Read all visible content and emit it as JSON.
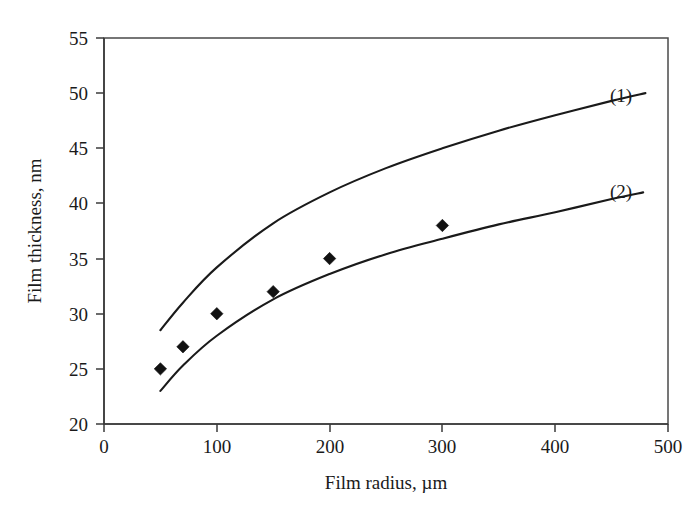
{
  "chart_data": {
    "type": "scatter",
    "title": "",
    "xlabel": "Film radius, µm",
    "ylabel": "Film thickness, nm",
    "xlim": [
      0,
      500
    ],
    "ylim": [
      20,
      55
    ],
    "xticks": [
      "0",
      "100",
      "200",
      "300",
      "400",
      "500"
    ],
    "xtick_values": [
      0,
      100,
      200,
      300,
      400,
      500
    ],
    "yticks": [
      "20",
      "25",
      "30",
      "35",
      "40",
      "45",
      "50",
      "55"
    ],
    "ytick_values": [
      20,
      25,
      30,
      35,
      40,
      45,
      50,
      55
    ],
    "grid": false,
    "legend_position": "inline-right-of-curve-ends",
    "frame": "full-box",
    "background": "#ffffff",
    "foreground": "#1a1a1a",
    "series": [
      {
        "name": "(1)",
        "label": "(1)",
        "type": "line",
        "marker": "none",
        "color": "#1a1a1a",
        "x": [
          50,
          70,
          100,
          150,
          200,
          250,
          300,
          350,
          400,
          450,
          480
        ],
        "y": [
          28.5,
          31.0,
          34.2,
          38.2,
          41.0,
          43.2,
          45.0,
          46.6,
          48.0,
          49.3,
          50.0
        ]
      },
      {
        "name": "(2)",
        "label": "(2)",
        "type": "line",
        "marker": "none",
        "color": "#1a1a1a",
        "x": [
          50,
          70,
          100,
          150,
          200,
          250,
          300,
          350,
          400,
          450,
          478
        ],
        "y": [
          23.0,
          25.3,
          28.0,
          31.3,
          33.6,
          35.4,
          36.8,
          38.1,
          39.2,
          40.4,
          41.0
        ]
      },
      {
        "name": "measured",
        "label": "",
        "type": "scatter",
        "marker": "diamond",
        "color": "#111111",
        "x": [
          50,
          70,
          100,
          150,
          200,
          300
        ],
        "y": [
          25,
          27,
          30,
          32,
          35,
          38
        ]
      }
    ],
    "curve_labels": [
      {
        "text": "(1)",
        "x": 500,
        "y": 50.0
      },
      {
        "text": "(2)",
        "x": 500,
        "y": 41.0
      }
    ]
  }
}
